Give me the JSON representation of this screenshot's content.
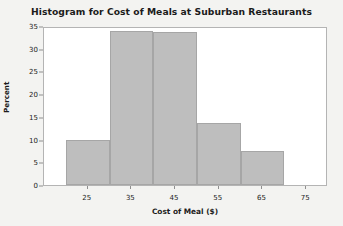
{
  "chart_data": {
    "type": "bar",
    "title": "Histogram for Cost of Meals at Suburban Restaurants",
    "xlabel": "Cost of Meal ($)",
    "ylabel": "Percent",
    "categories": [
      "20-30",
      "30-40",
      "40-50",
      "50-60",
      "60-70"
    ],
    "bin_edges": [
      20,
      30,
      40,
      50,
      60,
      70
    ],
    "values": [
      9.8,
      34.0,
      33.7,
      13.7,
      7.5
    ],
    "xlim": [
      15,
      80
    ],
    "ylim": [
      0,
      35
    ],
    "x_ticks": [
      25,
      35,
      45,
      55,
      65,
      75
    ],
    "x_tick_labels": [
      "25",
      "35",
      "45",
      "55",
      "65",
      "75"
    ],
    "y_ticks": [
      0,
      5,
      10,
      15,
      20,
      25,
      30,
      35
    ],
    "y_tick_labels": [
      "0",
      "5",
      "10",
      "15",
      "20",
      "25",
      "30",
      "35"
    ],
    "grid": false,
    "legend": false,
    "bar_fill_color": "#bebebe",
    "bar_border_color": "#a6a6a6",
    "plot_background": "#ffffff",
    "page_background": "#f3f3f1",
    "axis_color": "#b4b4b4",
    "text_color": "#1b1b1b"
  }
}
